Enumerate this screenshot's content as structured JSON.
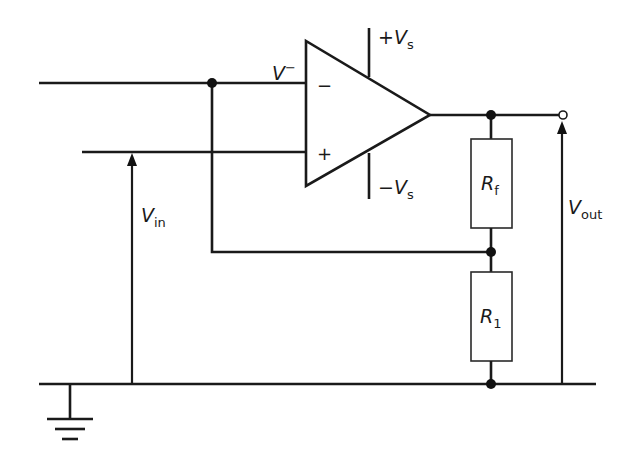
{
  "diagram": {
    "type": "non-inverting op-amp amplifier circuit",
    "opamp": {
      "inverting_input_symbol": "−",
      "noninverting_input_symbol": "+",
      "inverting_node_label": {
        "main": "V",
        "sup": "−"
      },
      "positive_supply_label": {
        "prefix": "+",
        "main": "V",
        "sub": "s"
      },
      "negative_supply_label": {
        "prefix": "−",
        "main": "V",
        "sub": "s"
      }
    },
    "resistors": [
      {
        "id": "feedback",
        "main": "R",
        "sub": "f"
      },
      {
        "id": "ground",
        "main": "R",
        "sub": "1"
      }
    ],
    "voltages": {
      "input": {
        "main": "V",
        "sub": "in"
      },
      "output": {
        "main": "V",
        "sub": "out"
      }
    },
    "ground_symbol": "ground",
    "colors": {
      "line": "#1a1a1a",
      "background": "#ffffff"
    }
  }
}
